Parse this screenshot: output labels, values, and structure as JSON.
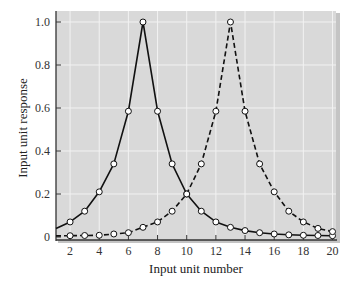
{
  "chart_data": {
    "type": "line",
    "title": "",
    "xlabel": "Input unit number",
    "ylabel": "Input unit response",
    "xlim": [
      1,
      20
    ],
    "ylim": [
      0,
      1.0
    ],
    "xticks": [
      2,
      4,
      6,
      8,
      10,
      12,
      14,
      16,
      18,
      20
    ],
    "xtick_labels": [
      "2",
      "4",
      "6",
      "8",
      "10",
      "12",
      "14",
      "16",
      "18",
      "20"
    ],
    "yticks": [
      0,
      0.2,
      0.4,
      0.6,
      0.8,
      1.0
    ],
    "ytick_labels": [
      "0",
      "0.2",
      "0.4",
      "0.6",
      "0.8",
      "1.0"
    ],
    "grid": true,
    "legend": null,
    "x": [
      2,
      3,
      4,
      5,
      6,
      7,
      8,
      9,
      10,
      11,
      12,
      13,
      14,
      15,
      16,
      17,
      18,
      19,
      20
    ],
    "series": [
      {
        "name": "solid",
        "style": "solid",
        "line_start_value_at_x1": 0.04,
        "values": [
          0.07,
          0.12,
          0.21,
          0.34,
          0.585,
          1.0,
          0.585,
          0.34,
          0.2,
          0.12,
          0.07,
          0.045,
          0.03,
          0.02,
          0.014,
          0.01,
          0.008,
          0.007,
          0.006
        ]
      },
      {
        "name": "dashed",
        "style": "dashed",
        "line_start_value_at_x1": 0.005,
        "values": [
          0.006,
          0.007,
          0.008,
          0.014,
          0.02,
          0.045,
          0.07,
          0.12,
          0.2,
          0.34,
          0.585,
          1.0,
          0.585,
          0.34,
          0.21,
          0.12,
          0.07,
          0.04,
          0.025
        ]
      }
    ]
  },
  "colors": {
    "plot_background": "#d9d9d9",
    "grid": "#f2f2f2",
    "line": "#111111",
    "marker_fill": "#ffffff",
    "axis": "#333333"
  }
}
